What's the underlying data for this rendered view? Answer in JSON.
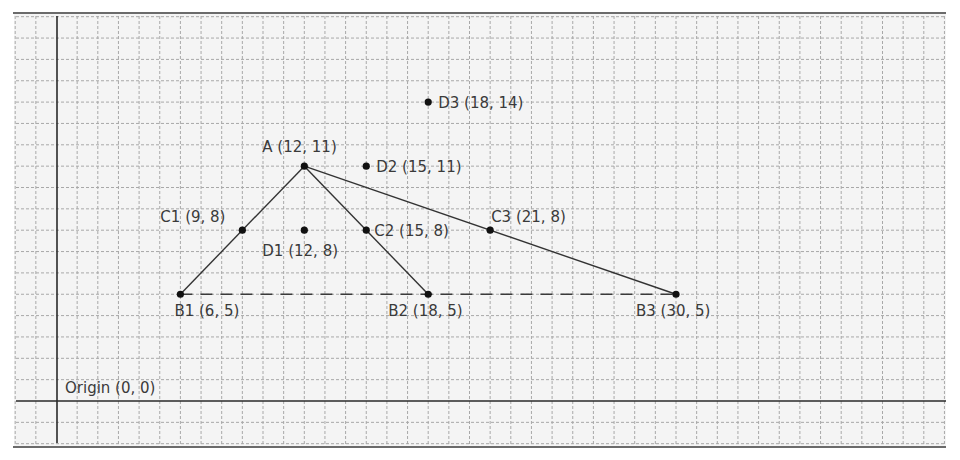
{
  "diagram": {
    "origin_label": "Origin (0, 0)",
    "colors": {
      "background": "#f4f4f4",
      "grid": "#a8a8a8",
      "axis": "#2a2a2a",
      "line": "#333333",
      "point": "#111111",
      "text": "#3a3a3a"
    },
    "points": [
      {
        "id": "A",
        "label": "A (12, 11)",
        "x": 12,
        "y": 11
      },
      {
        "id": "B1",
        "label": "B1 (6, 5)",
        "x": 6,
        "y": 5
      },
      {
        "id": "B2",
        "label": "B2 (18, 5)",
        "x": 18,
        "y": 5
      },
      {
        "id": "B3",
        "label": "B3 (30, 5)",
        "x": 30,
        "y": 5
      },
      {
        "id": "C1",
        "label": "C1 (9, 8)",
        "x": 9,
        "y": 8
      },
      {
        "id": "C2",
        "label": "C2 (15, 8)",
        "x": 15,
        "y": 8
      },
      {
        "id": "C3",
        "label": "C3 (21, 8)",
        "x": 21,
        "y": 8
      },
      {
        "id": "D1",
        "label": "D1 (12, 8)",
        "x": 12,
        "y": 8
      },
      {
        "id": "D2",
        "label": "D2 (15, 11)",
        "x": 15,
        "y": 11
      },
      {
        "id": "D3",
        "label": "D3 (18, 14)",
        "x": 18,
        "y": 14
      }
    ],
    "segments": [
      {
        "from": "A",
        "to": "B1",
        "style": "solid"
      },
      {
        "from": "A",
        "to": "B2",
        "style": "solid"
      },
      {
        "from": "A",
        "to": "B3",
        "style": "solid"
      },
      {
        "from": "B1",
        "to": "B3",
        "style": "dashed"
      }
    ]
  }
}
